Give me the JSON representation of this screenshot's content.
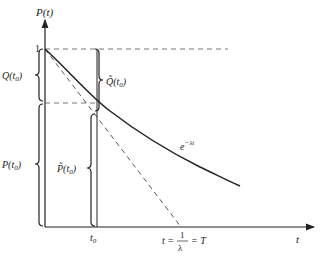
{
  "diagram": {
    "y_axis_label": "P(t)",
    "x_axis_label": "t",
    "y_tick_one": "1",
    "curve_label": "e",
    "curve_label_exp": "−λt",
    "t0_label": "t",
    "t0_sub": "0",
    "q_label": "Q(t",
    "q_label_sub": "0",
    "q_label_close": ")",
    "p_label": "P(t",
    "p_label_sub": "0",
    "p_label_close": ")",
    "q_tilde_label": "Q̃(t",
    "q_tilde_sub": "0",
    "q_tilde_close": ")",
    "p_tilde_label": "P̃(t",
    "p_tilde_sub": "0",
    "p_tilde_close": ")",
    "intercept_left": "t =",
    "intercept_num": "1",
    "intercept_den": "λ",
    "intercept_right": "= T",
    "colors": {
      "line": "#222222",
      "dashed": "#444444",
      "background": "#ffffff"
    }
  }
}
